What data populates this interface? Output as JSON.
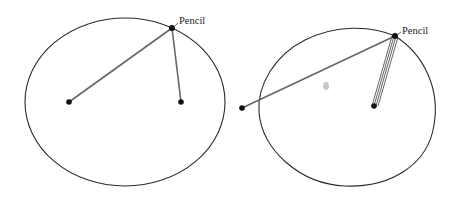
{
  "diagrams": [
    {
      "name": "ellipse-two-foci",
      "shape": "ellipse",
      "ellipse": {
        "cx": 125,
        "cy": 102,
        "rx": 100,
        "ry": 84
      },
      "pencil": {
        "x": 172,
        "y": 28,
        "label": "Pencil",
        "label_x": 178,
        "label_y": 24
      },
      "pins": [
        {
          "x": 69,
          "y": 102
        },
        {
          "x": 181,
          "y": 102
        }
      ]
    },
    {
      "name": "egg-curve-wound-string",
      "shape": "oval",
      "pencil": {
        "x": 395,
        "y": 36,
        "label": "Pencil",
        "label_x": 401,
        "label_y": 34
      },
      "pins": [
        {
          "x": 242,
          "y": 108
        },
        {
          "x": 374,
          "y": 106
        }
      ],
      "wound_strands": 4,
      "smudge": {
        "x": 326,
        "y": 86
      }
    }
  ],
  "colors": {
    "curve": "#2a2a2a",
    "string": "#666666",
    "pin": "#111111",
    "background": "#ffffff"
  }
}
